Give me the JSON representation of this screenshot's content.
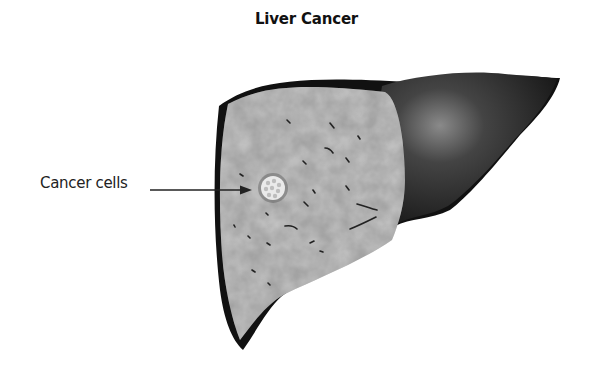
{
  "diagram": {
    "title": "Liver Cancer",
    "labels": [
      {
        "text": "Cancer cells",
        "points_to": "tumor-nodule"
      }
    ],
    "parts": [
      "liver-cut-section",
      "liver-right-lobe",
      "tumor-nodule"
    ],
    "colors": {
      "outline": "#111111",
      "cut_section": "#9a9a9a",
      "lobe": "#2b2b2b",
      "tumor": "#e8e8e8"
    }
  }
}
